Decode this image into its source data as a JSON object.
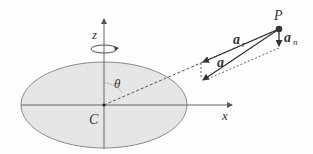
{
  "diagram": {
    "labels": {
      "z_axis": "z",
      "x_axis": "x",
      "center": "C",
      "angle": "θ",
      "point": "P",
      "vector_a": "a",
      "vector_ar_base": "a",
      "vector_ar_sub": "r",
      "vector_an_base": "a",
      "vector_an_sub": "n"
    },
    "colors": {
      "disk_fill": "#e6e6e6",
      "disk_stroke": "#8a8a8a",
      "line": "#555555",
      "text": "#333333",
      "point": "#333333"
    }
  }
}
